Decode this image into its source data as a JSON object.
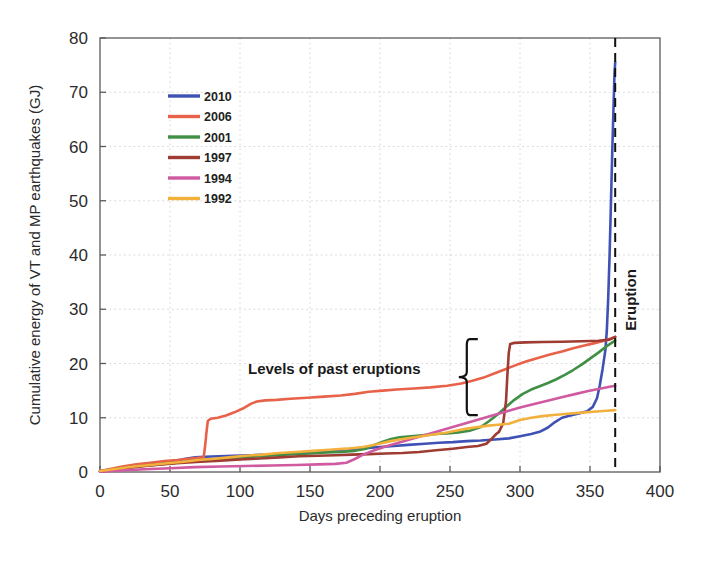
{
  "chart_data": {
    "type": "line",
    "title": "",
    "xlabel": "Days preceding eruption",
    "ylabel": "Cumulative energy of VT and MP earthquakes (GJ)",
    "xlim": [
      0,
      400
    ],
    "ylim": [
      0,
      80
    ],
    "xticks": [
      0,
      50,
      100,
      150,
      200,
      250,
      300,
      350,
      400
    ],
    "yticks": [
      0,
      10,
      20,
      30,
      40,
      50,
      60,
      70,
      80
    ],
    "grid": true,
    "legend_position": "upper-left-inside",
    "annotations": [
      {
        "name": "levels-of-past-eruptions",
        "text": "Levels of past eruptions",
        "x": 175,
        "y": 20.5
      },
      {
        "name": "eruption-marker",
        "text": "Eruption",
        "x": 368,
        "y": 36,
        "rotated": true,
        "line": "dashed-vertical"
      }
    ],
    "brace": {
      "x": 262,
      "y_top": 24.5,
      "y_bottom": 10.5
    },
    "eruption_line_x": 368,
    "series": [
      {
        "name": "2010",
        "color": "#3f51b5",
        "points": [
          [
            0,
            0.1
          ],
          [
            8,
            0.4
          ],
          [
            18,
            0.9
          ],
          [
            30,
            1.3
          ],
          [
            42,
            1.6
          ],
          [
            52,
            1.9
          ],
          [
            60,
            2.4
          ],
          [
            68,
            2.7
          ],
          [
            75,
            2.8
          ],
          [
            85,
            2.9
          ],
          [
            95,
            3.0
          ],
          [
            108,
            3.1
          ],
          [
            120,
            3.2
          ],
          [
            132,
            3.4
          ],
          [
            145,
            3.6
          ],
          [
            158,
            3.8
          ],
          [
            168,
            4.0
          ],
          [
            178,
            4.2
          ],
          [
            190,
            4.4
          ],
          [
            200,
            4.6
          ],
          [
            210,
            4.8
          ],
          [
            220,
            5.0
          ],
          [
            232,
            5.2
          ],
          [
            242,
            5.4
          ],
          [
            252,
            5.5
          ],
          [
            262,
            5.7
          ],
          [
            272,
            5.8
          ],
          [
            282,
            6.0
          ],
          [
            292,
            6.2
          ],
          [
            300,
            6.6
          ],
          [
            308,
            7.0
          ],
          [
            314,
            7.4
          ],
          [
            320,
            8.2
          ],
          [
            325,
            9.2
          ],
          [
            330,
            10.0
          ],
          [
            336,
            10.4
          ],
          [
            342,
            10.8
          ],
          [
            348,
            11.2
          ],
          [
            352,
            12.0
          ],
          [
            355,
            13.6
          ],
          [
            357,
            16.0
          ],
          [
            359,
            19.0
          ],
          [
            361,
            22.5
          ],
          [
            362,
            26.0
          ],
          [
            363,
            32.0
          ],
          [
            364,
            40.0
          ],
          [
            365,
            50.0
          ],
          [
            366,
            60.0
          ],
          [
            367,
            69.0
          ],
          [
            367.5,
            73.5
          ],
          [
            368,
            75.5
          ]
        ]
      },
      {
        "name": "2006",
        "color": "#e8624a",
        "points": [
          [
            0,
            0.2
          ],
          [
            8,
            0.6
          ],
          [
            16,
            1.0
          ],
          [
            26,
            1.4
          ],
          [
            36,
            1.7
          ],
          [
            46,
            2.0
          ],
          [
            55,
            2.2
          ],
          [
            62,
            2.4
          ],
          [
            70,
            2.6
          ],
          [
            74,
            2.7
          ],
          [
            75,
            4.6
          ],
          [
            76,
            7.2
          ],
          [
            77,
            9.4
          ],
          [
            79,
            9.8
          ],
          [
            84,
            10.0
          ],
          [
            90,
            10.4
          ],
          [
            96,
            11.0
          ],
          [
            102,
            11.7
          ],
          [
            108,
            12.6
          ],
          [
            112,
            13.0
          ],
          [
            118,
            13.2
          ],
          [
            126,
            13.3
          ],
          [
            136,
            13.5
          ],
          [
            148,
            13.7
          ],
          [
            160,
            13.9
          ],
          [
            172,
            14.1
          ],
          [
            182,
            14.4
          ],
          [
            192,
            14.8
          ],
          [
            202,
            15.0
          ],
          [
            212,
            15.2
          ],
          [
            224,
            15.4
          ],
          [
            236,
            15.6
          ],
          [
            248,
            15.9
          ],
          [
            258,
            16.3
          ],
          [
            266,
            16.8
          ],
          [
            274,
            17.4
          ],
          [
            282,
            18.2
          ],
          [
            290,
            19.0
          ],
          [
            298,
            19.8
          ],
          [
            306,
            20.5
          ],
          [
            314,
            21.1
          ],
          [
            322,
            21.7
          ],
          [
            330,
            22.2
          ],
          [
            338,
            22.8
          ],
          [
            346,
            23.3
          ],
          [
            354,
            23.8
          ],
          [
            360,
            24.2
          ],
          [
            365,
            24.6
          ],
          [
            368,
            24.9
          ]
        ]
      },
      {
        "name": "2001",
        "color": "#3f8f44",
        "points": [
          [
            0,
            0.1
          ],
          [
            10,
            0.5
          ],
          [
            22,
            0.9
          ],
          [
            34,
            1.2
          ],
          [
            46,
            1.5
          ],
          [
            58,
            1.8
          ],
          [
            68,
            2.1
          ],
          [
            78,
            2.3
          ],
          [
            90,
            2.5
          ],
          [
            102,
            2.7
          ],
          [
            114,
            2.9
          ],
          [
            126,
            3.1
          ],
          [
            138,
            3.3
          ],
          [
            150,
            3.4
          ],
          [
            162,
            3.6
          ],
          [
            172,
            3.7
          ],
          [
            182,
            3.9
          ],
          [
            190,
            4.3
          ],
          [
            196,
            5.0
          ],
          [
            202,
            5.6
          ],
          [
            208,
            6.1
          ],
          [
            214,
            6.4
          ],
          [
            222,
            6.6
          ],
          [
            232,
            6.8
          ],
          [
            240,
            7.0
          ],
          [
            248,
            7.1
          ],
          [
            256,
            7.3
          ],
          [
            264,
            7.6
          ],
          [
            272,
            8.3
          ],
          [
            278,
            9.4
          ],
          [
            284,
            10.6
          ],
          [
            290,
            12.0
          ],
          [
            296,
            13.3
          ],
          [
            302,
            14.4
          ],
          [
            308,
            15.2
          ],
          [
            314,
            15.8
          ],
          [
            320,
            16.4
          ],
          [
            326,
            17.1
          ],
          [
            332,
            17.9
          ],
          [
            338,
            18.8
          ],
          [
            344,
            19.8
          ],
          [
            350,
            20.9
          ],
          [
            356,
            22.0
          ],
          [
            362,
            23.2
          ],
          [
            366,
            23.9
          ],
          [
            368,
            24.2
          ]
        ]
      },
      {
        "name": "1997",
        "color": "#9e3b32",
        "points": [
          [
            0,
            0.15
          ],
          [
            12,
            0.5
          ],
          [
            24,
            0.9
          ],
          [
            36,
            1.2
          ],
          [
            48,
            1.5
          ],
          [
            60,
            1.7
          ],
          [
            72,
            1.9
          ],
          [
            86,
            2.1
          ],
          [
            100,
            2.3
          ],
          [
            114,
            2.5
          ],
          [
            128,
            2.7
          ],
          [
            142,
            2.9
          ],
          [
            156,
            3.0
          ],
          [
            168,
            3.1
          ],
          [
            180,
            3.2
          ],
          [
            192,
            3.3
          ],
          [
            204,
            3.4
          ],
          [
            216,
            3.5
          ],
          [
            228,
            3.7
          ],
          [
            240,
            4.0
          ],
          [
            252,
            4.3
          ],
          [
            262,
            4.6
          ],
          [
            270,
            4.8
          ],
          [
            276,
            5.2
          ],
          [
            280,
            6.2
          ],
          [
            283,
            7.0
          ],
          [
            285,
            7.4
          ],
          [
            288,
            9.0
          ],
          [
            290,
            13.0
          ],
          [
            291,
            18.0
          ],
          [
            292,
            22.0
          ],
          [
            293,
            23.6
          ],
          [
            296,
            23.8
          ],
          [
            304,
            23.9
          ],
          [
            316,
            23.95
          ],
          [
            330,
            24.0
          ],
          [
            344,
            24.1
          ],
          [
            356,
            24.2
          ],
          [
            364,
            24.4
          ],
          [
            368,
            24.9
          ]
        ]
      },
      {
        "name": "1994",
        "color": "#cf5aa0",
        "points": [
          [
            0,
            0.05
          ],
          [
            16,
            0.3
          ],
          [
            32,
            0.5
          ],
          [
            50,
            0.7
          ],
          [
            68,
            0.9
          ],
          [
            86,
            1.0
          ],
          [
            104,
            1.1
          ],
          [
            122,
            1.2
          ],
          [
            140,
            1.3
          ],
          [
            156,
            1.4
          ],
          [
            168,
            1.5
          ],
          [
            176,
            1.7
          ],
          [
            182,
            2.4
          ],
          [
            188,
            3.2
          ],
          [
            196,
            4.0
          ],
          [
            204,
            4.7
          ],
          [
            212,
            5.3
          ],
          [
            220,
            5.9
          ],
          [
            228,
            6.5
          ],
          [
            236,
            7.1
          ],
          [
            244,
            7.7
          ],
          [
            252,
            8.3
          ],
          [
            260,
            8.9
          ],
          [
            268,
            9.5
          ],
          [
            276,
            10.1
          ],
          [
            284,
            10.7
          ],
          [
            292,
            11.3
          ],
          [
            300,
            11.9
          ],
          [
            308,
            12.4
          ],
          [
            316,
            12.9
          ],
          [
            324,
            13.4
          ],
          [
            332,
            13.9
          ],
          [
            340,
            14.4
          ],
          [
            348,
            14.9
          ],
          [
            356,
            15.3
          ],
          [
            364,
            15.7
          ],
          [
            368,
            15.9
          ]
        ]
      },
      {
        "name": "1992",
        "color": "#f2b03c",
        "points": [
          [
            0,
            0.2
          ],
          [
            12,
            0.6
          ],
          [
            24,
            1.0
          ],
          [
            36,
            1.3
          ],
          [
            48,
            1.6
          ],
          [
            60,
            1.9
          ],
          [
            70,
            2.2
          ],
          [
            80,
            2.4
          ],
          [
            92,
            2.7
          ],
          [
            104,
            3.0
          ],
          [
            116,
            3.2
          ],
          [
            128,
            3.5
          ],
          [
            140,
            3.7
          ],
          [
            152,
            3.9
          ],
          [
            164,
            4.1
          ],
          [
            176,
            4.3
          ],
          [
            188,
            4.6
          ],
          [
            198,
            5.1
          ],
          [
            206,
            5.6
          ],
          [
            214,
            6.0
          ],
          [
            222,
            6.3
          ],
          [
            230,
            6.6
          ],
          [
            238,
            6.9
          ],
          [
            246,
            7.2
          ],
          [
            254,
            7.6
          ],
          [
            262,
            8.0
          ],
          [
            270,
            8.3
          ],
          [
            276,
            8.5
          ],
          [
            284,
            8.7
          ],
          [
            292,
            8.9
          ],
          [
            300,
            9.6
          ],
          [
            308,
            10.0
          ],
          [
            316,
            10.3
          ],
          [
            324,
            10.5
          ],
          [
            332,
            10.7
          ],
          [
            342,
            10.9
          ],
          [
            352,
            11.1
          ],
          [
            362,
            11.3
          ],
          [
            368,
            11.4
          ]
        ]
      }
    ]
  },
  "legend": {
    "items": [
      {
        "label": "2010",
        "color": "#3f51b5"
      },
      {
        "label": "2006",
        "color": "#e8624a"
      },
      {
        "label": "2001",
        "color": "#3f8f44"
      },
      {
        "label": "1997",
        "color": "#9e3b32"
      },
      {
        "label": "1994",
        "color": "#cf5aa0"
      },
      {
        "label": "1992",
        "color": "#f2b03c"
      }
    ]
  },
  "axes": {
    "x_title": "Days preceding eruption",
    "y_title": "Cumulative energy of VT and MP earthquakes (GJ)",
    "x_tick_labels": [
      "0",
      "50",
      "100",
      "150",
      "200",
      "250",
      "300",
      "350",
      "400"
    ],
    "y_tick_labels": [
      "0",
      "10",
      "20",
      "30",
      "40",
      "50",
      "60",
      "70",
      "80"
    ]
  },
  "annotations": {
    "past_eruptions": "Levels of past eruptions",
    "eruption": "Eruption"
  }
}
